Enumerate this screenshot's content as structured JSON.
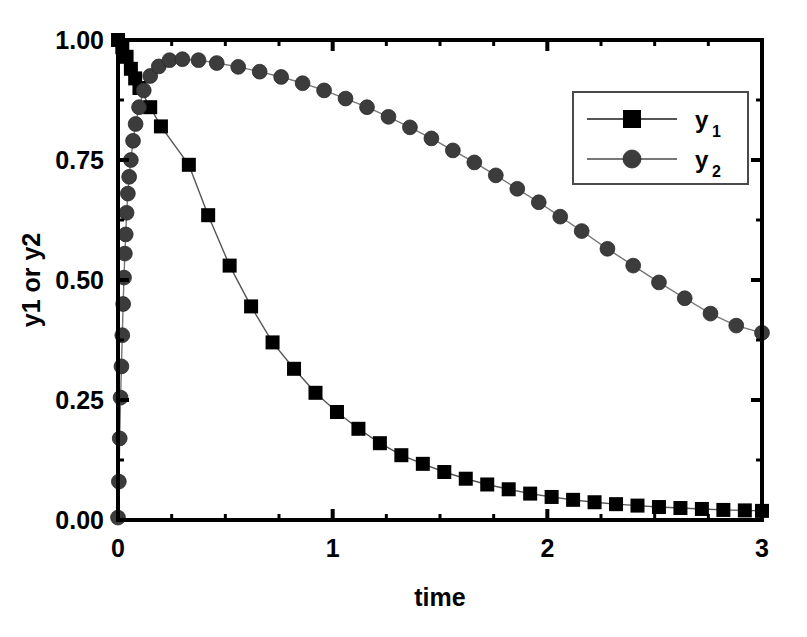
{
  "chart_data": {
    "type": "line",
    "title": "",
    "xlabel": "time",
    "ylabel": "y1 or y2",
    "xlim": [
      0,
      3
    ],
    "ylim": [
      0,
      1.0
    ],
    "xticks": [
      0,
      1,
      2,
      3
    ],
    "xtick_labels": [
      "0",
      "1",
      "2",
      "3"
    ],
    "yticks": [
      0.0,
      0.25,
      0.5,
      0.75,
      1.0
    ],
    "ytick_labels": [
      "0.00",
      "0.25",
      "0.50",
      "0.75",
      "1.00"
    ],
    "x_minor_step": 0.25,
    "y_minor_step": 0.125,
    "grid": false,
    "frame": "box",
    "ticks_direction": "in",
    "legend": {
      "position": "upper-right",
      "border": true,
      "entries": [
        {
          "base": "y",
          "sub": "1",
          "marker": "square",
          "color": "#000000",
          "line_color": "#555555"
        },
        {
          "base": "y",
          "sub": "2",
          "marker": "circle",
          "color": "#3c3c3c",
          "line_color": "#777777"
        }
      ]
    },
    "series": [
      {
        "name": "y1",
        "marker": "square",
        "color": "#000000",
        "line_color": "#555555",
        "x": [
          0.0,
          0.02,
          0.04,
          0.06,
          0.08,
          0.1,
          0.15,
          0.2,
          0.33,
          0.42,
          0.52,
          0.62,
          0.72,
          0.82,
          0.92,
          1.02,
          1.12,
          1.22,
          1.32,
          1.42,
          1.52,
          1.62,
          1.72,
          1.82,
          1.92,
          2.02,
          2.12,
          2.22,
          2.32,
          2.42,
          2.52,
          2.62,
          2.72,
          2.82,
          2.92,
          3.0
        ],
        "y": [
          1.0,
          0.985,
          0.965,
          0.94,
          0.92,
          0.9,
          0.86,
          0.82,
          0.74,
          0.635,
          0.53,
          0.445,
          0.37,
          0.315,
          0.265,
          0.225,
          0.19,
          0.16,
          0.135,
          0.117,
          0.1,
          0.086,
          0.074,
          0.064,
          0.055,
          0.048,
          0.042,
          0.037,
          0.033,
          0.03,
          0.027,
          0.025,
          0.023,
          0.021,
          0.02,
          0.019
        ]
      },
      {
        "name": "y2",
        "marker": "circle",
        "color": "#3c3c3c",
        "line_color": "#777777",
        "x": [
          0.0,
          0.004,
          0.008,
          0.012,
          0.016,
          0.02,
          0.024,
          0.028,
          0.032,
          0.036,
          0.04,
          0.046,
          0.052,
          0.06,
          0.07,
          0.082,
          0.098,
          0.12,
          0.15,
          0.19,
          0.24,
          0.3,
          0.375,
          0.46,
          0.56,
          0.66,
          0.76,
          0.86,
          0.96,
          1.06,
          1.16,
          1.26,
          1.36,
          1.46,
          1.56,
          1.66,
          1.76,
          1.86,
          1.96,
          2.06,
          2.16,
          2.28,
          2.4,
          2.52,
          2.64,
          2.76,
          2.88,
          3.0
        ],
        "y": [
          0.005,
          0.08,
          0.17,
          0.255,
          0.32,
          0.385,
          0.45,
          0.505,
          0.555,
          0.595,
          0.64,
          0.68,
          0.715,
          0.75,
          0.79,
          0.825,
          0.86,
          0.895,
          0.925,
          0.945,
          0.958,
          0.96,
          0.958,
          0.952,
          0.944,
          0.934,
          0.923,
          0.91,
          0.895,
          0.878,
          0.86,
          0.84,
          0.818,
          0.795,
          0.77,
          0.745,
          0.718,
          0.69,
          0.662,
          0.632,
          0.602,
          0.565,
          0.53,
          0.495,
          0.462,
          0.43,
          0.405,
          0.39
        ]
      }
    ]
  },
  "figure": {
    "background_color": "#ffffff",
    "axis_color": "#000000",
    "text_color": "#000000"
  }
}
